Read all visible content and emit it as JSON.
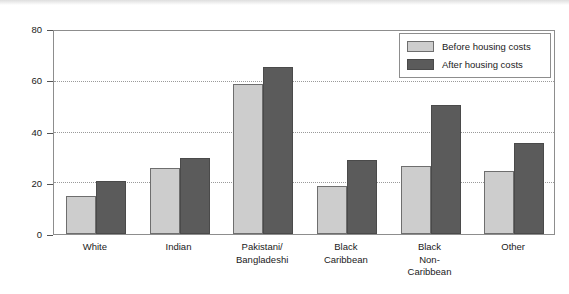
{
  "chart_data": {
    "type": "bar",
    "title": "",
    "xlabel": "",
    "ylabel": "Great Britain Percentages",
    "ylim": [
      0,
      80
    ],
    "yticks": [
      "0",
      "20",
      "40",
      "60",
      "80"
    ],
    "grid": true,
    "legend_position": "top-right",
    "categories": [
      "White",
      "Pakistani/\nBangladeshi",
      "Indian",
      "Black\nCaribbean",
      "Black\nNon-\nCaribbean",
      "Other"
    ],
    "category_labels": [
      {
        "line1": "White",
        "line2": "",
        "line3": ""
      },
      {
        "line1": "Indian",
        "line2": "",
        "line3": ""
      },
      {
        "line1": "Pakistani/",
        "line2": "Bangladeshi",
        "line3": ""
      },
      {
        "line1": "Black",
        "line2": "Caribbean",
        "line3": ""
      },
      {
        "line1": "Black",
        "line2": "Non-",
        "line3": "Caribbean"
      },
      {
        "line1": "Other",
        "line2": "",
        "line3": ""
      }
    ],
    "series": [
      {
        "name": "Before housing costs",
        "color": "#cdcdcd",
        "values": [
          15,
          26,
          59,
          19,
          27,
          25
        ]
      },
      {
        "name": "After housing costs",
        "color": "#5b5b5b",
        "values": [
          21,
          30,
          66,
          29,
          51,
          36
        ]
      }
    ]
  }
}
